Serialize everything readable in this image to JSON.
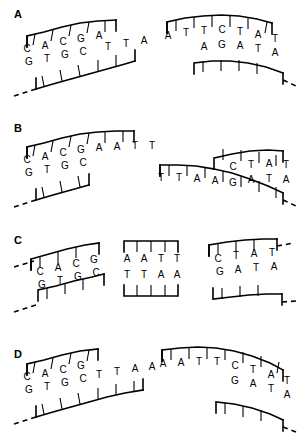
{
  "figure": {
    "type": "dna-restriction-ligation-diagram",
    "background_color": "#ffffff",
    "line_color": "#000000",
    "panel_count": 4
  },
  "panels": [
    {
      "label": "A",
      "fragments": [
        {
          "name": "left-duplex",
          "top_strand": [
            "C",
            "A",
            "C",
            "G",
            "A",
            "T",
            "T",
            "A"
          ],
          "bottom_strand": [
            "G",
            "T",
            "G",
            "C"
          ],
          "top_overhang": [
            "A",
            "T",
            "T",
            "A"
          ],
          "continues_left": true
        },
        {
          "name": "right-duplex",
          "top_strand": [
            "A",
            "T",
            "T",
            "C",
            "T",
            "A",
            "T"
          ],
          "bottom_strand": [
            "A",
            "G",
            "A",
            "T",
            "A"
          ],
          "top_overhang": [
            "A",
            "T",
            "T"
          ],
          "continues_right": true
        }
      ]
    },
    {
      "label": "B",
      "fragments": [
        {
          "name": "left-duplex",
          "top_strand": [
            "C",
            "A",
            "C",
            "G",
            "A",
            "A",
            "T",
            "T"
          ],
          "bottom_strand": [
            "G",
            "T",
            "G",
            "C"
          ],
          "top_overhang": [
            "A",
            "A",
            "T",
            "T"
          ],
          "continues_left": true
        },
        {
          "name": "right-duplex",
          "top_strand": [
            "T",
            "T",
            "A",
            "A",
            "C",
            "T",
            "A",
            "T"
          ],
          "bottom_strand": [
            "G",
            "A",
            "T",
            "A"
          ],
          "top_overhang": [
            "T",
            "T",
            "A",
            "A"
          ],
          "continues_right": true
        }
      ]
    },
    {
      "label": "C",
      "fragments": [
        {
          "name": "left-duplex",
          "top_strand": [
            "C",
            "A",
            "C",
            "G"
          ],
          "bottom_strand": [
            "G",
            "T",
            "G",
            "C"
          ],
          "continues_left": true
        },
        {
          "name": "middle-duplex",
          "top_strand": [
            "A",
            "A",
            "T",
            "T"
          ],
          "bottom_strand": [
            "T",
            "T",
            "A",
            "A"
          ],
          "continues_left": false,
          "continues_right": false
        },
        {
          "name": "right-duplex",
          "top_strand": [
            "C",
            "T",
            "A",
            "T"
          ],
          "bottom_strand": [
            "G",
            "A",
            "T",
            "A"
          ],
          "continues_right": true
        }
      ]
    },
    {
      "label": "D",
      "fragments": [
        {
          "name": "left-duplex",
          "top_strand": [
            "C",
            "A",
            "C",
            "G",
            "T",
            "T",
            "A",
            "A"
          ],
          "bottom_strand": [
            "G",
            "T",
            "G",
            "C"
          ],
          "top_overhang": [
            "T",
            "T",
            "A",
            "A"
          ],
          "continues_left": true
        },
        {
          "name": "right-duplex",
          "top_strand": [
            "A",
            "A",
            "T",
            "T",
            "C",
            "T",
            "A",
            "T"
          ],
          "bottom_strand": [
            "G",
            "A",
            "T",
            "A"
          ],
          "top_overhang": [
            "A",
            "A",
            "T",
            "T"
          ],
          "continues_right": true
        }
      ]
    }
  ]
}
